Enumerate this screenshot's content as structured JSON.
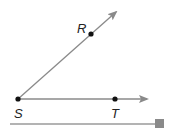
{
  "diagram": {
    "points": {
      "R": {
        "label": "R",
        "x": 91,
        "y": 34
      },
      "S": {
        "label": "S",
        "x": 18,
        "y": 99
      },
      "T": {
        "label": "T",
        "x": 115,
        "y": 99
      }
    },
    "rays": [
      {
        "name": "ray-SR",
        "from": "S",
        "through": "R"
      },
      {
        "name": "ray-ST",
        "from": "S",
        "through": "T"
      }
    ],
    "colors": {
      "ray": "#8a8a8a",
      "point": "#111111",
      "label": "#222222",
      "baseline": "#9a9a9a",
      "handle": "#8a8a8a"
    }
  }
}
